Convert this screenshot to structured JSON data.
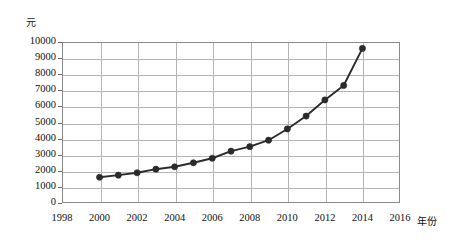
{
  "chart_data": {
    "type": "line",
    "title": "",
    "subtitle": "",
    "xlabel": "年份",
    "ylabel": "元",
    "ylabel_position": "top-left",
    "grid": true,
    "legend": "none",
    "xlim": [
      1998,
      2016
    ],
    "ylim": [
      0,
      10000
    ],
    "x_tick_labels": [
      "1998",
      "2000",
      "2002",
      "2004",
      "2006",
      "2008",
      "2010",
      "2012",
      "2014",
      "2016"
    ],
    "x_tick_values": [
      1998,
      2000,
      2002,
      2004,
      2006,
      2008,
      2010,
      2012,
      2014,
      2016
    ],
    "y_tick_labels": [
      "0",
      "1000",
      "2000",
      "3000",
      "4000",
      "5000",
      "6000",
      "7000",
      "8000",
      "9000",
      "10000"
    ],
    "y_tick_values": [
      0,
      1000,
      2000,
      3000,
      4000,
      5000,
      6000,
      7000,
      8000,
      9000,
      10000
    ],
    "x": [
      2000,
      2001,
      2002,
      2003,
      2004,
      2005,
      2006,
      2007,
      2008,
      2009,
      2010,
      2011,
      2012,
      2013,
      2014
    ],
    "values": [
      1600,
      1730,
      1880,
      2100,
      2250,
      2500,
      2780,
      3220,
      3500,
      3900,
      4600,
      5400,
      6400,
      7300,
      9600
    ],
    "series": [
      {
        "name": "",
        "x": [
          2000,
          2001,
          2002,
          2003,
          2004,
          2005,
          2006,
          2007,
          2008,
          2009,
          2010,
          2011,
          2012,
          2013,
          2014
        ],
        "values": [
          1600,
          1730,
          1880,
          2100,
          2250,
          2500,
          2780,
          3220,
          3500,
          3900,
          4600,
          5400,
          6400,
          7300,
          9600
        ],
        "color": "#2b2b2b",
        "marker": "circle"
      }
    ],
    "colors": {
      "line": "#2b2b2b",
      "marker": "#2b2b2b",
      "grid": "#b3b3b3",
      "frame": "#8a8a8a",
      "background": "#ffffff",
      "text": "#111111"
    }
  }
}
